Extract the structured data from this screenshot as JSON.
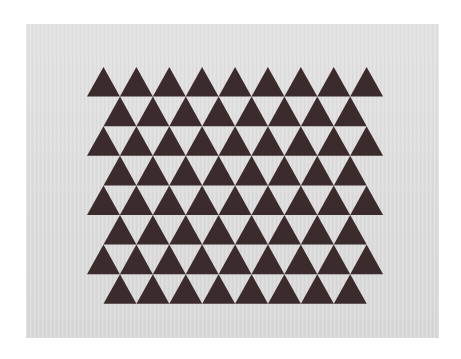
{
  "image": {
    "description": "Photograph of a sheet of light grey paper printed with a tessellated grid of dark brown equilateral triangles arranged in 8 staggered rows",
    "background_color": "#ffffff",
    "paper_color": "#dedddd",
    "triangle_color": "#3b2b2c"
  },
  "pattern": {
    "rows": 8,
    "first_apex_y": 67,
    "row_height": 29.6,
    "triangle_width": 32.9,
    "odd_row": {
      "count": 9,
      "start_x": 87
    },
    "even_row": {
      "count": 8,
      "start_x": 103.5
    }
  }
}
